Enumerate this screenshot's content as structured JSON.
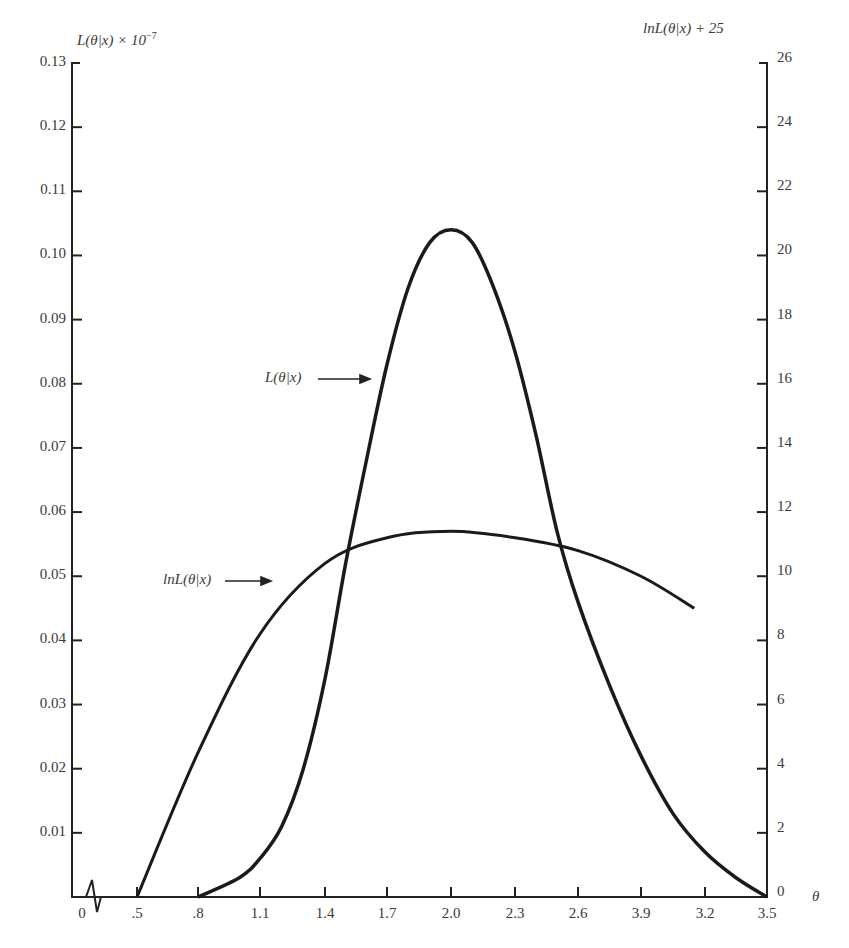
{
  "chart_data": {
    "type": "line",
    "title": "",
    "xlabel": "θ",
    "ylabel_left": "L(θ|x) × 10⁻⁷",
    "ylabel_right": "lnL(θ|x) + 25",
    "x_tick_labels": [
      "0",
      ".5",
      ".8",
      "1.1",
      "1.4",
      "1.7",
      "2.0",
      "2.3",
      "2.6",
      "3.9",
      "3.2",
      "3.5"
    ],
    "y_left_ticks": [
      "0.01",
      "0.02",
      "0.03",
      "0.04",
      "0.05",
      "0.06",
      "0.07",
      "0.08",
      "0.09",
      "0.10",
      "0.11",
      "0.12",
      "0.13"
    ],
    "y_left_range": [
      0,
      0.13
    ],
    "y_right_ticks": [
      "0",
      "2",
      "4",
      "6",
      "8",
      "10",
      "12",
      "14",
      "16",
      "18",
      "20",
      "22",
      "24",
      "26"
    ],
    "y_right_range": [
      0,
      26
    ],
    "axis_break": "zigzag between 0 and .5 on x-axis",
    "grid": false,
    "series": [
      {
        "name": "L(θ|x)",
        "axis": "left",
        "x": [
          0.8,
          1.0,
          1.1,
          1.2,
          1.3,
          1.4,
          1.5,
          1.6,
          1.7,
          1.8,
          1.9,
          2.0,
          2.1,
          2.2,
          2.3,
          2.4,
          2.5,
          2.6,
          2.75,
          2.9,
          3.05,
          3.2,
          3.35,
          3.5
        ],
        "values": [
          0.0,
          0.003,
          0.006,
          0.011,
          0.02,
          0.034,
          0.052,
          0.068,
          0.083,
          0.095,
          0.102,
          0.104,
          0.102,
          0.095,
          0.085,
          0.072,
          0.057,
          0.046,
          0.033,
          0.022,
          0.013,
          0.007,
          0.003,
          0.0
        ]
      },
      {
        "name": "lnL(θ|x)",
        "axis": "right",
        "x": [
          0.5,
          0.8,
          1.1,
          1.4,
          1.7,
          2.0,
          2.3,
          2.6,
          2.9,
          3.15
        ],
        "values": [
          0.0,
          4.5,
          8.2,
          10.4,
          11.2,
          11.4,
          11.2,
          10.8,
          10.0,
          9.0
        ]
      }
    ],
    "annotations": [
      {
        "text": "L(θ|x)",
        "arrow_to": "L curve at θ≈1.55"
      },
      {
        "text": "lnL(θ|x)",
        "arrow_to": "lnL curve at θ≈1.0"
      }
    ]
  },
  "labels": {
    "left_axis_title_main": "L(θ|x) × 10",
    "left_axis_title_exp": "−7",
    "right_axis_title": "lnL(θ|x) + 25",
    "x_axis_title": "θ",
    "curve_L": "L(θ|x)",
    "curve_lnL": "lnL(θ|x)"
  }
}
